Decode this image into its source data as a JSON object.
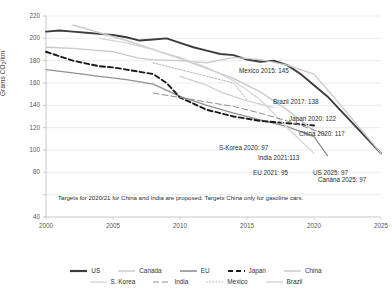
{
  "chart_data": {
    "type": "line",
    "title": "",
    "xlabel": "",
    "ylabel": "Grams CO2/km",
    "xlim": [
      2000,
      2025
    ],
    "ylim": [
      40,
      220
    ],
    "yticks": [
      40,
      60,
      80,
      100,
      120,
      140,
      160,
      180,
      200,
      220
    ],
    "ytick_labels": [
      "40",
      "",
      "80",
      "100",
      "120",
      "140",
      "160",
      "180",
      "200",
      "220"
    ],
    "xticks": [
      2000,
      2005,
      2010,
      2015,
      2020,
      2025
    ],
    "xtick_labels": [
      "2000",
      "2005",
      "2010",
      "2015",
      "2020",
      "2025"
    ],
    "grid": true,
    "legend_position": "bottom",
    "series": [
      {
        "name": "US",
        "color": "#3d3d3d",
        "width": 1.9,
        "dash": "none",
        "x": [
          2000,
          2001,
          2002,
          2003,
          2004,
          2005,
          2006,
          2007,
          2008,
          2009,
          2010,
          2011,
          2012,
          2013,
          2014,
          2015,
          2016,
          2017,
          2018,
          2019,
          2020,
          2021,
          2025
        ],
        "y": [
          206,
          207,
          206,
          205,
          204,
          203,
          201,
          198,
          199,
          200,
          196,
          192,
          189,
          186,
          185,
          181,
          179,
          180,
          176,
          168,
          158,
          148,
          97
        ]
      },
      {
        "name": "Canada",
        "color": "#c9c9c9",
        "width": 1.3,
        "dash": "none",
        "x": [
          2000,
          2002,
          2004,
          2005,
          2006,
          2007,
          2008,
          2010,
          2012,
          2014,
          2016,
          2018,
          2020,
          2022,
          2025
        ],
        "y": [
          192,
          191,
          189,
          188,
          185,
          182,
          181,
          180,
          178,
          183,
          181,
          176,
          168,
          140,
          97
        ]
      },
      {
        "name": "EU",
        "color": "#909090",
        "width": 1.3,
        "dash": "none",
        "x": [
          2000,
          2002,
          2004,
          2006,
          2008,
          2010,
          2012,
          2014,
          2016,
          2018,
          2020,
          2021
        ],
        "y": [
          172,
          169,
          166,
          163,
          159,
          148,
          140,
          133,
          127,
          121,
          112,
          95
        ]
      },
      {
        "name": "Japan",
        "color": "#1a1a1a",
        "width": 1.9,
        "dash": "5,3",
        "x": [
          2000,
          2002,
          2004,
          2005,
          2006,
          2007,
          2008,
          2009,
          2010,
          2012,
          2014,
          2016,
          2018,
          2020
        ],
        "y": [
          188,
          180,
          175,
          174,
          172,
          170,
          168,
          160,
          147,
          136,
          130,
          126,
          124,
          122
        ]
      },
      {
        "name": "China",
        "color": "#cccccc",
        "width": 1.5,
        "dash": "none",
        "x": [
          2002,
          2004,
          2006,
          2008,
          2010,
          2012,
          2014,
          2016,
          2018,
          2020
        ],
        "y": [
          212,
          205,
          198,
          190,
          182,
          173,
          164,
          152,
          136,
          117
        ]
      },
      {
        "name": "S. Korea",
        "color": "#d6d6d6",
        "width": 1.3,
        "dash": "none",
        "x": [
          2004,
          2006,
          2008,
          2010,
          2012,
          2014,
          2016,
          2018,
          2020
        ],
        "y": [
          200,
          196,
          190,
          183,
          174,
          162,
          145,
          120,
          97
        ]
      },
      {
        "name": "India",
        "color": "#8f8f8f",
        "width": 1.0,
        "dash": "6,3",
        "x": [
          2008,
          2010,
          2012,
          2014,
          2016,
          2018,
          2020,
          2021
        ],
        "y": [
          151,
          147,
          143,
          139,
          133,
          126,
          118,
          113
        ]
      },
      {
        "name": "Mexico",
        "color": "#b5b5b5",
        "width": 1.0,
        "dash": "1.6,1.6",
        "x": [
          2008,
          2010,
          2012,
          2013,
          2014,
          2015
        ],
        "y": [
          178,
          172,
          166,
          163,
          160,
          145
        ]
      },
      {
        "name": "Brazil",
        "color": "#d0d0d0",
        "width": 1.3,
        "dash": "none",
        "x": [
          2010,
          2012,
          2013,
          2014,
          2015,
          2016,
          2017
        ],
        "y": [
          166,
          158,
          152,
          148,
          144,
          141,
          138
        ]
      }
    ],
    "annotations": [
      {
        "text": "Mexico 2015: 145",
        "x": 239,
        "y": 67
      },
      {
        "text": "Brazil 2017: 138",
        "x": 273,
        "y": 98
      },
      {
        "text": "Japan 2020: 122",
        "x": 289,
        "y": 115
      },
      {
        "text": "China 2020: 117",
        "x": 299,
        "y": 130
      },
      {
        "text": "S-Korea 2020: 97",
        "x": 219,
        "y": 144
      },
      {
        "text": "India 2021:113",
        "x": 258,
        "y": 154
      },
      {
        "text": "EU 2021: 95",
        "x": 253,
        "y": 169
      },
      {
        "text": "US 2025: 97",
        "x": 313,
        "y": 169
      },
      {
        "text": "Canana 2025: 97",
        "x": 318,
        "y": 176
      }
    ],
    "footnote": "Targets for 2020/21 for China and India are proposed. Targets China only for gasoline cars.",
    "legend_rows": [
      [
        {
          "label": "US",
          "color": "#3d3d3d",
          "width": 2.2,
          "dash": "none"
        },
        {
          "label": "Canada",
          "color": "#c9c9c9",
          "width": 1.4,
          "dash": "none"
        },
        {
          "label": "EU",
          "color": "#909090",
          "width": 1.6,
          "dash": "none"
        },
        {
          "label": "Japan",
          "color": "#1a1a1a",
          "width": 2.2,
          "dash": "5,3"
        },
        {
          "label": "China",
          "color": "#cccccc",
          "width": 1.6,
          "dash": "none"
        }
      ],
      [
        {
          "label": "S. Korea",
          "color": "#d6d6d6",
          "width": 1.4,
          "dash": "none"
        },
        {
          "label": "India",
          "color": "#8f8f8f",
          "width": 1.2,
          "dash": "6,3"
        },
        {
          "label": "Mexico",
          "color": "#b5b5b5",
          "width": 1.2,
          "dash": "1.6,1.6"
        },
        {
          "label": "Brazil",
          "color": "#d0d0d0",
          "width": 1.4,
          "dash": "none"
        }
      ]
    ]
  }
}
